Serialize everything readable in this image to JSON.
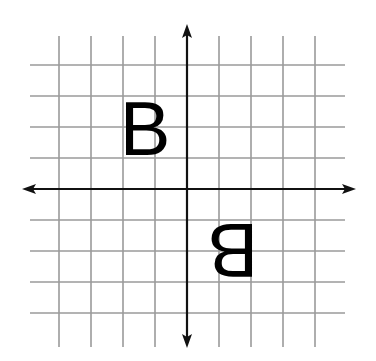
{
  "diagram": {
    "type": "coordinate-grid-reflection",
    "grid": {
      "line_color": "#9a9a9a",
      "vertical_x": [
        59,
        91,
        123,
        155,
        219,
        251,
        283,
        315
      ],
      "horizontal_y": [
        65,
        96,
        127,
        158,
        220,
        251,
        282,
        313
      ],
      "x_extent": [
        30,
        345
      ],
      "y_extent": [
        36,
        347
      ]
    },
    "axes": {
      "color": "#111111",
      "x_axis": {
        "y": 189,
        "from": 22,
        "to": 356
      },
      "y_axis": {
        "x": 187,
        "from": 24,
        "to": 348
      }
    },
    "figures": [
      {
        "label": "B",
        "quadrant": "II",
        "orientation": "normal",
        "x": 145,
        "y": 128
      },
      {
        "label": "B",
        "quadrant": "IV",
        "orientation": "rotated-180",
        "x": 233,
        "y": 250
      }
    ]
  }
}
